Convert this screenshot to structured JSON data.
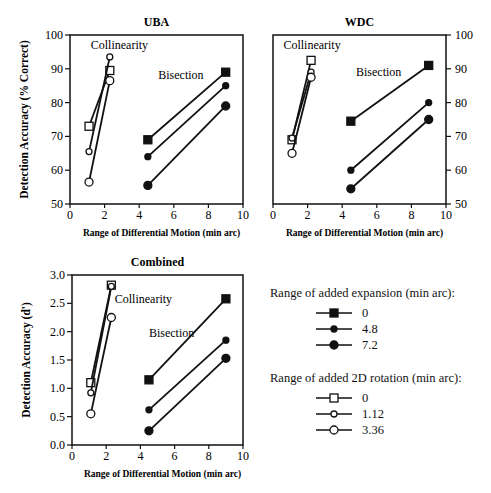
{
  "chart_data": [
    {
      "type": "line",
      "title": "UBA",
      "xlabel": "Range of Differential Motion (min arc)",
      "ylabel": "Detection Accuracy (% Correct)",
      "xlim": [
        0,
        10
      ],
      "ylim": [
        50,
        100
      ],
      "xticks": [
        0,
        2,
        4,
        6,
        8,
        10
      ],
      "yticks": [
        50,
        60,
        70,
        80,
        90,
        100
      ],
      "y_axis_side": "left",
      "annotations": [
        {
          "text": "Collinearity",
          "x": 1.2,
          "y": 96
        },
        {
          "text": "Bisection",
          "x": 5.1,
          "y": 87
        }
      ],
      "series": [
        {
          "name": "Expansion 0",
          "task": "Bisection",
          "marker": "filled-square",
          "x": [
            4.5,
            9.0
          ],
          "y": [
            69,
            89
          ]
        },
        {
          "name": "Expansion 4.8",
          "task": "Bisection",
          "marker": "filled-diamond",
          "x": [
            4.5,
            9.0
          ],
          "y": [
            64,
            85
          ]
        },
        {
          "name": "Expansion 7.2",
          "task": "Bisection",
          "marker": "filled-circle",
          "x": [
            4.5,
            9.0
          ],
          "y": [
            55.5,
            79
          ]
        },
        {
          "name": "Rotation 0",
          "task": "Collinearity",
          "marker": "open-square",
          "x": [
            1.1,
            2.3
          ],
          "y": [
            73,
            89.5
          ]
        },
        {
          "name": "Rotation 1.12",
          "task": "Collinearity",
          "marker": "open-diamond",
          "x": [
            1.1,
            2.3
          ],
          "y": [
            65.5,
            93.5
          ]
        },
        {
          "name": "Rotation 3.36",
          "task": "Collinearity",
          "marker": "open-circle",
          "x": [
            1.1,
            2.3
          ],
          "y": [
            56.5,
            86.5
          ]
        }
      ]
    },
    {
      "type": "line",
      "title": "WDC",
      "xlabel": "Range of Differential Motion (min arc)",
      "ylabel": "",
      "xlim": [
        0,
        10
      ],
      "ylim": [
        50,
        100
      ],
      "xticks": [
        0,
        2,
        4,
        6,
        8,
        10
      ],
      "yticks": [
        50,
        60,
        70,
        80,
        90,
        100
      ],
      "y_axis_side": "right",
      "annotations": [
        {
          "text": "Collinearity",
          "x": 0.6,
          "y": 96
        },
        {
          "text": "Bisection",
          "x": 4.8,
          "y": 88
        }
      ],
      "series": [
        {
          "name": "Expansion 0",
          "task": "Bisection",
          "marker": "filled-square",
          "x": [
            4.5,
            9.0
          ],
          "y": [
            74.5,
            91
          ]
        },
        {
          "name": "Expansion 4.8",
          "task": "Bisection",
          "marker": "filled-diamond",
          "x": [
            4.5,
            9.0
          ],
          "y": [
            60,
            80
          ]
        },
        {
          "name": "Expansion 7.2",
          "task": "Bisection",
          "marker": "filled-circle",
          "x": [
            4.5,
            9.0
          ],
          "y": [
            54.5,
            75
          ]
        },
        {
          "name": "Rotation 0",
          "task": "Collinearity",
          "marker": "open-square",
          "x": [
            1.1,
            2.2
          ],
          "y": [
            69,
            92.5
          ]
        },
        {
          "name": "Rotation 1.12",
          "task": "Collinearity",
          "marker": "open-diamond",
          "x": [
            1.1,
            2.2
          ],
          "y": [
            69.5,
            89
          ]
        },
        {
          "name": "Rotation 3.36",
          "task": "Collinearity",
          "marker": "open-circle",
          "x": [
            1.1,
            2.2
          ],
          "y": [
            65,
            87.5
          ]
        }
      ]
    },
    {
      "type": "line",
      "title": "Combined",
      "xlabel": "Range of Differential Motion (min arc)",
      "ylabel": "Detection Accuracy (d')",
      "xlim": [
        0,
        10
      ],
      "ylim": [
        0,
        3
      ],
      "xticks": [
        0,
        2,
        4,
        6,
        8,
        10
      ],
      "yticks": [
        0.0,
        0.5,
        1.0,
        1.5,
        2.0,
        2.5,
        3.0
      ],
      "y_axis_side": "left",
      "annotations": [
        {
          "text": "Collinearity",
          "x": 2.5,
          "y": 2.5
        },
        {
          "text": "Bisection",
          "x": 4.5,
          "y": 1.9
        }
      ],
      "series": [
        {
          "name": "Expansion 0",
          "task": "Bisection",
          "marker": "filled-square",
          "x": [
            4.5,
            9.0
          ],
          "y": [
            1.15,
            2.58
          ]
        },
        {
          "name": "Expansion 4.8",
          "task": "Bisection",
          "marker": "filled-diamond",
          "x": [
            4.5,
            9.0
          ],
          "y": [
            0.62,
            1.85
          ]
        },
        {
          "name": "Expansion 7.2",
          "task": "Bisection",
          "marker": "filled-circle",
          "x": [
            4.5,
            9.0
          ],
          "y": [
            0.25,
            1.53
          ]
        },
        {
          "name": "Rotation 0",
          "task": "Collinearity",
          "marker": "open-square",
          "x": [
            1.1,
            2.3
          ],
          "y": [
            1.1,
            2.82
          ]
        },
        {
          "name": "Rotation 1.12",
          "task": "Collinearity",
          "marker": "open-diamond",
          "x": [
            1.1,
            2.3
          ],
          "y": [
            0.92,
            2.8
          ]
        },
        {
          "name": "Rotation 3.36",
          "task": "Collinearity",
          "marker": "open-circle",
          "x": [
            1.1,
            2.3
          ],
          "y": [
            0.55,
            2.25
          ]
        }
      ]
    }
  ],
  "legend": {
    "expansion": {
      "title": "Range of added expansion (min arc):",
      "items": [
        {
          "label": "0",
          "marker": "filled-square"
        },
        {
          "label": "4.8",
          "marker": "filled-diamond"
        },
        {
          "label": "7.2",
          "marker": "filled-circle"
        }
      ]
    },
    "rotation": {
      "title": "Range of added 2D rotation (min arc):",
      "items": [
        {
          "label": "0",
          "marker": "open-square"
        },
        {
          "label": "1.12",
          "marker": "open-diamond"
        },
        {
          "label": "3.36",
          "marker": "open-circle"
        }
      ]
    }
  },
  "layout": {
    "panels": [
      {
        "left": 70,
        "right": 243,
        "top": 35,
        "bottom": 204
      },
      {
        "left": 273,
        "right": 446,
        "top": 35,
        "bottom": 204
      },
      {
        "left": 72,
        "right": 243,
        "top": 275,
        "bottom": 445
      }
    ]
  }
}
